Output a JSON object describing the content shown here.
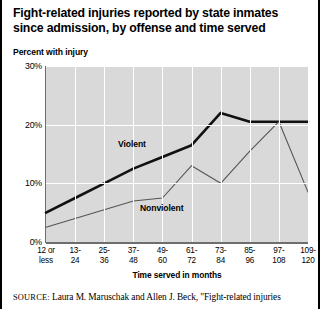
{
  "title": "Fight-related injuries reported by state inmates since admission, by offense and time served",
  "subtitle": "Percent with injury",
  "source": {
    "label": "SOURCE:",
    "text": "Laura M. Maruschak and Allen J. Beck, \"Fight-related injuries"
  },
  "chart_data": {
    "type": "line",
    "title": "Fight-related injuries reported by state inmates since admission, by offense and time served",
    "subtitle": "Percent with injury",
    "xlabel": "Time served in months",
    "ylabel": "Percent with injury",
    "ylim": [
      0,
      30
    ],
    "yticks": [
      "0%",
      "10%",
      "20%",
      "30%"
    ],
    "ytick_values": [
      0,
      10,
      20,
      30
    ],
    "grid": true,
    "legend": "inline-labels",
    "categories": [
      "12 or less",
      "13-24",
      "25-36",
      "37-48",
      "49-60",
      "61-72",
      "73-84",
      "85-96",
      "97-108",
      "109-120"
    ],
    "series": [
      {
        "name": "Violent",
        "color": "#111111",
        "values": [
          5.0,
          7.5,
          10.0,
          12.5,
          14.5,
          16.5,
          22.0,
          20.5,
          20.5,
          20.5
        ]
      },
      {
        "name": "Nonviolent",
        "color": "#555555",
        "values": [
          2.5,
          4.0,
          5.5,
          7.0,
          7.5,
          13.0,
          10.0,
          15.5,
          20.5,
          8.5
        ]
      }
    ]
  }
}
